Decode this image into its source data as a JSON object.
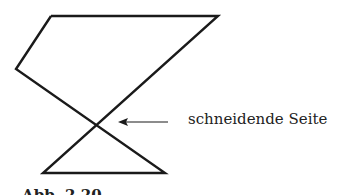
{
  "diagram": {
    "type": "self-intersecting polygon",
    "vertices": [
      [
        51,
        16
      ],
      [
        218,
        16
      ],
      [
        40,
        125
      ],
      [
        165,
        173
      ],
      [
        43,
        173
      ],
      [
        16,
        69
      ]
    ],
    "intersection_point": [
      92,
      123
    ],
    "label": "schneidende Seite",
    "caption": "Abb. 2.20",
    "colors": {
      "stroke": "#1a1a1a",
      "text": "#222222",
      "background": "#ffffff"
    }
  }
}
